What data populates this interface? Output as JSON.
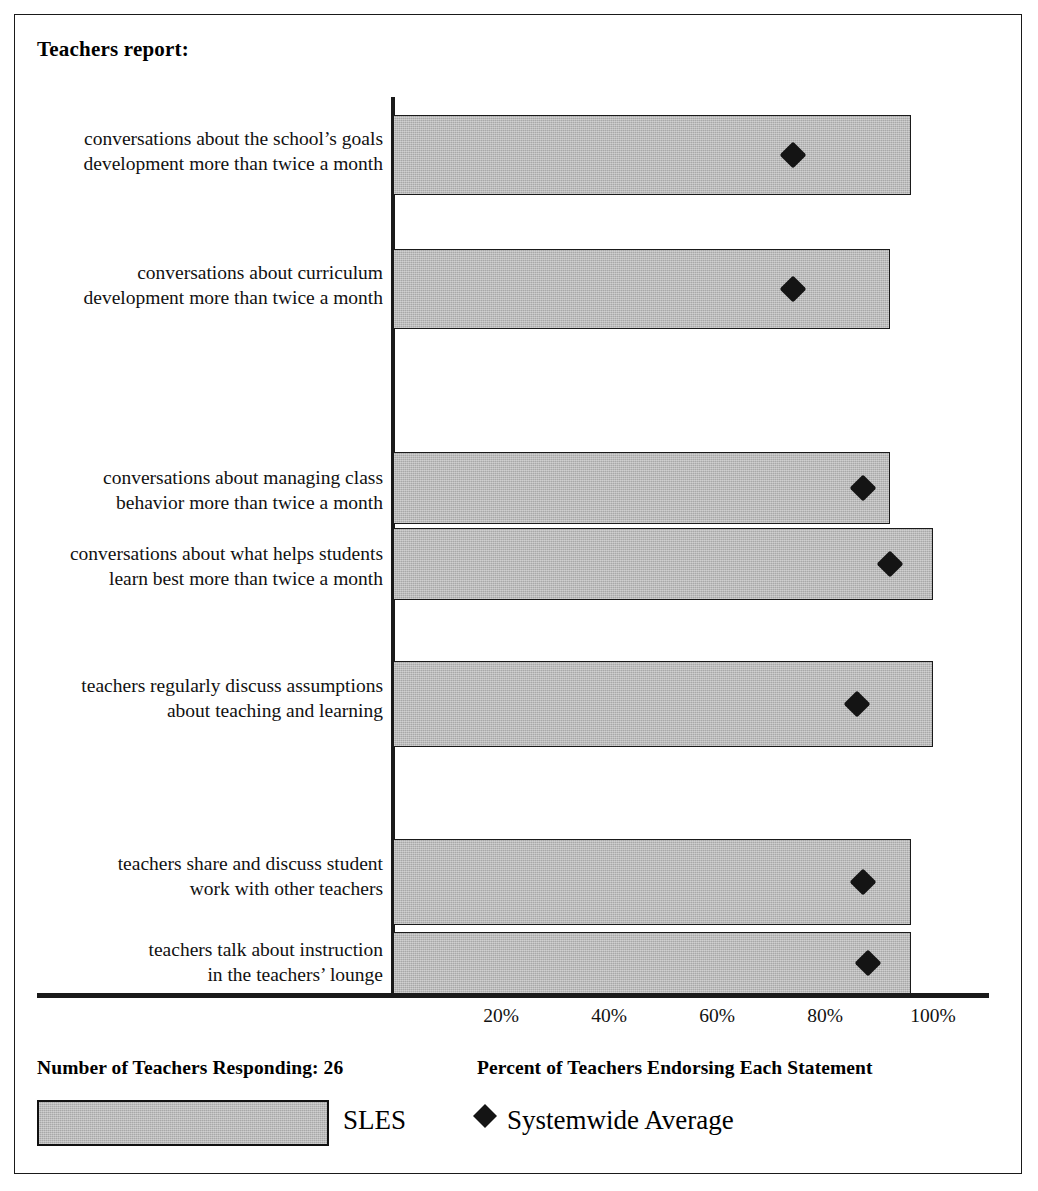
{
  "title": "Teachers report:",
  "footer": {
    "respondents": "Number of Teachers Responding: 26",
    "axis_caption": "Percent of Teachers Endorsing Each Statement",
    "legend_bar_label": "SLES",
    "legend_marker_label": "Systemwide Average",
    "legend_marker_glyph": "◆"
  },
  "colors": {
    "bar_fill": "#a8a8a8",
    "bar_stroke": "#1a1a1a",
    "marker": "#141414",
    "frame": "#1a1a1a",
    "background": "#ffffff"
  },
  "chart_data": {
    "type": "bar",
    "orientation": "horizontal",
    "title": "Teachers report:",
    "xlabel": "Percent of Teachers Endorsing Each Statement",
    "ylabel": "",
    "xlim": [
      0,
      110
    ],
    "grid": false,
    "legend_position": "bottom",
    "xticks": [
      20,
      40,
      60,
      80,
      100
    ],
    "xticklabels": [
      "20%",
      "40%",
      "60%",
      "80%",
      "100%"
    ],
    "categories": [
      "conversations about the school’s goals development more than twice a month",
      "conversations about curriculum development more than twice a month",
      "conversations about managing class behavior more than twice a month",
      "conversations about what helps students learn best more than twice a month",
      "teachers regularly discuss assumptions about teaching and learning",
      "teachers share and discuss student work with other teachers",
      "teachers talk about instruction in the teachers’ lounge"
    ],
    "series": [
      {
        "name": "SLES",
        "type": "bar",
        "values": [
          96,
          92,
          92,
          100,
          100,
          96,
          96
        ]
      },
      {
        "name": "Systemwide Average",
        "type": "marker",
        "values": [
          74,
          74,
          87,
          92,
          86,
          87,
          88
        ]
      }
    ]
  },
  "rows": [
    {
      "label_line1": "conversations about the school’s goals",
      "label_line2": "development more than twice a month",
      "bar_value": 96,
      "marker_value": 74,
      "top": 100,
      "height": 80,
      "label_top": 111
    },
    {
      "label_line1": "conversations about curriculum",
      "label_line2": "development more than twice a month",
      "bar_value": 92,
      "marker_value": 74,
      "top": 234,
      "height": 80,
      "label_top": 245
    },
    {
      "label_line1": "conversations about managing class",
      "label_line2": "behavior more than twice a month",
      "bar_value": 92,
      "marker_value": 87,
      "top": 437,
      "height": 72,
      "label_top": 450
    },
    {
      "label_line1": "conversations about what helps students",
      "label_line2": "learn best more than twice a month",
      "bar_value": 100,
      "marker_value": 92,
      "top": 513,
      "height": 72,
      "label_top": 526
    },
    {
      "label_line1": "teachers regularly discuss assumptions",
      "label_line2": "about teaching and learning",
      "bar_value": 100,
      "marker_value": 86,
      "top": 646,
      "height": 86,
      "label_top": 658
    },
    {
      "label_line1": "teachers share and discuss student",
      "label_line2": "work with other teachers",
      "bar_value": 96,
      "marker_value": 87,
      "top": 824,
      "height": 86,
      "label_top": 836
    },
    {
      "label_line1": "teachers talk about instruction",
      "label_line2": "in the teachers’ lounge",
      "bar_value": 96,
      "marker_value": 88,
      "top": 917,
      "height": 62,
      "label_top": 922
    }
  ]
}
